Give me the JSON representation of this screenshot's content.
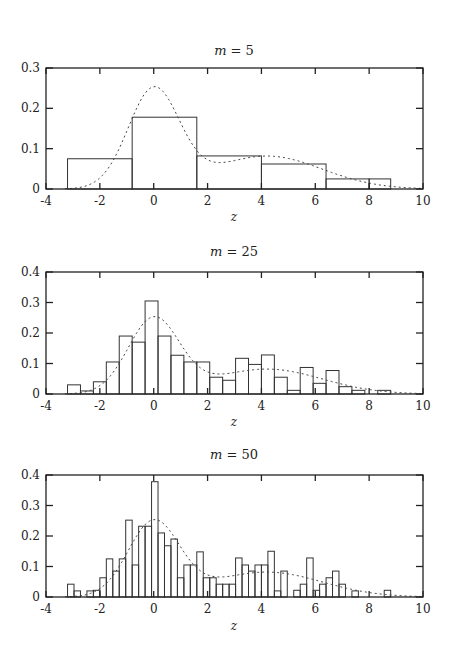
{
  "chart_data": [
    {
      "type": "bar",
      "title": "m = 5",
      "title_var": "m",
      "title_value": "5",
      "xlabel": "z",
      "ylabel": "",
      "xlim": [
        -4,
        10
      ],
      "ylim": [
        0,
        0.3
      ],
      "xticks": [
        "-4",
        "-2",
        "0",
        "2",
        "4",
        "6",
        "8",
        "10"
      ],
      "yticks": [
        "0",
        "0.1",
        "0.2",
        "0.3"
      ],
      "bins": [
        {
          "x0": -3.2,
          "x1": -0.8,
          "value": 0.075
        },
        {
          "x0": -0.8,
          "x1": 1.6,
          "value": 0.178
        },
        {
          "x0": 1.6,
          "x1": 4.0,
          "value": 0.082
        },
        {
          "x0": 4.0,
          "x1": 6.4,
          "value": 0.062
        },
        {
          "x0": 6.4,
          "x1": 8.0,
          "value": 0.025
        },
        {
          "x0": 8.0,
          "x1": 8.8,
          "value": 0.025
        }
      ],
      "density_curve": "dashed mixture density, peak ~0.25 at z=0, shoulder ~0.08 near z=4"
    },
    {
      "type": "bar",
      "title": "m = 25",
      "title_var": "m",
      "title_value": "25",
      "xlabel": "z",
      "ylabel": "",
      "xlim": [
        -4,
        10
      ],
      "ylim": [
        0,
        0.4
      ],
      "xticks": [
        "-4",
        "-2",
        "0",
        "2",
        "4",
        "6",
        "8",
        "10"
      ],
      "yticks": [
        "0",
        "0.1",
        "0.2",
        "0.3",
        "0.4"
      ],
      "bin_start": -3.2,
      "bin_width": 0.48,
      "values": [
        0.03,
        0.01,
        0.04,
        0.105,
        0.19,
        0.17,
        0.305,
        0.19,
        0.127,
        0.105,
        0.105,
        0.055,
        0.045,
        0.117,
        0.097,
        0.128,
        0.055,
        0.012,
        0.087,
        0.035,
        0.077,
        0.024,
        0.012,
        0.0,
        0.012
      ],
      "density_curve": "dashed mixture density, peak ~0.25 at z=0, shoulder ~0.08 near z=4"
    },
    {
      "type": "bar",
      "title": "m = 50",
      "title_var": "m",
      "title_value": "50",
      "xlabel": "z",
      "ylabel": "",
      "xlim": [
        -4,
        10
      ],
      "ylim": [
        0,
        0.4
      ],
      "xticks": [
        "-4",
        "-2",
        "0",
        "2",
        "4",
        "6",
        "8",
        "10"
      ],
      "yticks": [
        "0",
        "0.1",
        "0.2",
        "0.3",
        "0.4"
      ],
      "bin_start": -3.2,
      "bin_width": 0.24,
      "values": [
        0.042,
        0.02,
        0.0,
        0.02,
        0.022,
        0.063,
        0.125,
        0.085,
        0.125,
        0.252,
        0.105,
        0.232,
        0.232,
        0.378,
        0.21,
        0.168,
        0.19,
        0.063,
        0.105,
        0.105,
        0.148,
        0.063,
        0.063,
        0.042,
        0.042,
        0.042,
        0.128,
        0.105,
        0.085,
        0.105,
        0.105,
        0.15,
        0.02,
        0.085,
        0.0,
        0.022,
        0.042,
        0.128,
        0.022,
        0.042,
        0.063,
        0.085,
        0.042,
        0.0,
        0.02,
        0.0,
        0.0,
        0.0,
        0.0,
        0.022
      ],
      "density_curve": "dashed mixture density, peak ~0.25 at z=0, shoulder ~0.08 near z=4"
    }
  ],
  "panels": [
    {
      "title_var": "m",
      "title_eq": "= 5",
      "xlabel": "z"
    },
    {
      "title_var": "m",
      "title_eq": "= 25",
      "xlabel": "z"
    },
    {
      "title_var": "m",
      "title_eq": "= 50",
      "xlabel": "z"
    }
  ],
  "colors": {
    "axis": "#222222",
    "bar_stroke": "#333333",
    "curve": "#444444",
    "background": "#ffffff"
  }
}
